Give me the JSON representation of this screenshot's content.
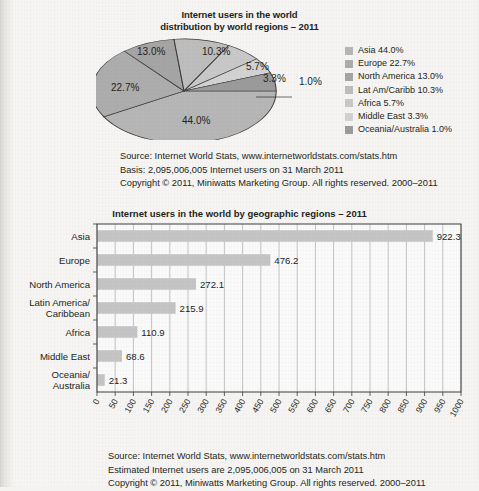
{
  "pie_section": {
    "title_line1": "Internet users in the world",
    "title_line2": "distribution by world regions – 2011",
    "slice_labels": {
      "asia": "44.0%",
      "europe": "22.7%",
      "north_america": "13.0%",
      "lat_am_caribb": "10.3%",
      "africa": "5.7%",
      "middle_east": "3.3%",
      "oceania_australia": "1.0%"
    },
    "legend": [
      {
        "label": "Asia 44.0%",
        "color": "#b0b0b0"
      },
      {
        "label": "Europe 22.7%",
        "color": "#a8a8a8"
      },
      {
        "label": "North America 13.0%",
        "color": "#9f9f9f"
      },
      {
        "label": "Lat Am/Caribb 10.3%",
        "color": "#bdbdbd"
      },
      {
        "label": "Africa 5.7%",
        "color": "#c9c9c9"
      },
      {
        "label": "Middle East 3.3%",
        "color": "#d4d4d4"
      },
      {
        "label": "Oceania/Australia 1.0%",
        "color": "#a0a0a0"
      }
    ],
    "notes": [
      "Source: Internet World Stats, www.internetworldstats.com/stats.htm",
      "Basis: 2,095,006,005 Internet users on 31 March 2011",
      "Copyright © 2011, Miniwatts Marketing Group. All rights reserved. 2000–2011"
    ]
  },
  "bar_section": {
    "title": "Internet users in the world by geographic regions – 2011",
    "notes": [
      "Source: Internet World Stats, www.internetworldstats.com/stats.htm",
      "Estimated Internet users are 2,095,006,005 on 31 March 2011",
      "Copyright © 2011, Miniwatts Marketing Group. All rights reserved. 2000–2011"
    ]
  },
  "chart_data": [
    {
      "type": "pie",
      "title": "Internet users in the world distribution by world regions – 2011",
      "categories": [
        "Asia",
        "Europe",
        "North America",
        "Lat Am/Caribb",
        "Africa",
        "Middle East",
        "Oceania/Australia"
      ],
      "values": [
        44.0,
        22.7,
        13.0,
        10.3,
        5.7,
        3.3,
        1.0
      ],
      "unit": "percent",
      "legend_position": "right",
      "data_labels": [
        "44.0%",
        "22.7%",
        "13.0%",
        "10.3%",
        "5.7%",
        "3.3%",
        "1.0%"
      ]
    },
    {
      "type": "bar",
      "orientation": "horizontal",
      "title": "Internet users in the world by geographic regions – 2011",
      "categories": [
        "Asia",
        "Europe",
        "North America",
        "Latin America/\nCaribbean",
        "Africa",
        "Middle East",
        "Oceania/\nAustralia"
      ],
      "category_lines": [
        [
          "Asia"
        ],
        [
          "Europe"
        ],
        [
          "North America"
        ],
        [
          "Latin America/",
          "Caribbean"
        ],
        [
          "Africa"
        ],
        [
          "Middle East"
        ],
        [
          "Oceania/",
          "Australia"
        ]
      ],
      "values": [
        922.3,
        476.2,
        272.1,
        215.9,
        110.9,
        68.6,
        21.3
      ],
      "data_labels": [
        "922.3",
        "476.2",
        "272.1",
        "215.9",
        "110.9",
        "68.6",
        "21.3"
      ],
      "xlabel": "",
      "ylabel": "",
      "xlim": [
        0,
        1000
      ],
      "xticks": [
        0,
        50,
        100,
        150,
        200,
        250,
        300,
        350,
        400,
        450,
        500,
        550,
        600,
        650,
        700,
        750,
        800,
        850,
        900,
        950,
        1000
      ],
      "xtick_labels": [
        "0",
        "50",
        "100",
        "150",
        "200",
        "250",
        "300",
        "350",
        "400",
        "450",
        "500",
        "550",
        "600",
        "650",
        "700",
        "750",
        "800",
        "850",
        "900",
        "950",
        "1000"
      ],
      "grid": "vertical",
      "bar_color": "#c4c4c4",
      "unit": "millions of users"
    }
  ]
}
